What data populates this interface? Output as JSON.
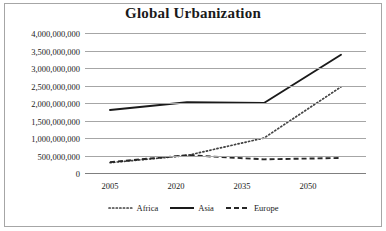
{
  "chart_data": {
    "type": "line",
    "title": "Global Urbanization",
    "xlabel": "",
    "ylabel": "",
    "x": [
      2005,
      2020,
      2035,
      2050
    ],
    "categories": [
      "2005",
      "2020",
      "2035",
      "2050"
    ],
    "series": [
      {
        "name": "Africa",
        "style": "dotted",
        "color": "#404040",
        "values": [
          295000000,
          500000000,
          1000000000,
          2460000000
        ]
      },
      {
        "name": "Asia",
        "style": "solid",
        "color": "#1a1a1a",
        "values": [
          1800000000,
          2020000000,
          2000000000,
          3380000000
        ]
      },
      {
        "name": "Europe",
        "style": "dashed",
        "color": "#262626",
        "values": [
          310000000,
          510000000,
          390000000,
          430000000
        ]
      }
    ],
    "ylim": [
      0,
      4000000000
    ],
    "ytick_values": [
      0,
      500000000,
      1000000000,
      1500000000,
      2000000000,
      2500000000,
      3000000000,
      3500000000,
      4000000000
    ],
    "ytick_labels": [
      "0",
      "500,000,000",
      "1,000,000,000",
      "1,500,000,000",
      "2,000,000,000",
      "2,500,000,000",
      "3,000,000,000",
      "3,500,000,000",
      "4,000,000,000"
    ],
    "xtick_labels": [
      "2005",
      "2020",
      "2035",
      "2050"
    ],
    "grid": true,
    "legend_position": "bottom",
    "legend_entries": [
      "Africa",
      "Asia",
      "Europe"
    ],
    "border_color": "#a6a6a6",
    "gridline_color": "#a6a6a6",
    "background_color": "#ffffff"
  }
}
